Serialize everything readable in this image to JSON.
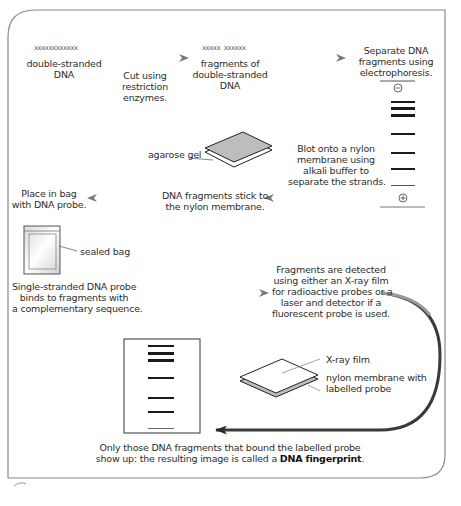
{
  "diagram": {
    "colors": {
      "frame": "#7a7a7a",
      "arrow_grey": "#8a8a8a",
      "arrow_dark": "#2a2a2a",
      "band": "#1a1a1a",
      "gel_fill": "#bdbdbd"
    },
    "row1": {
      "dna_glyph_1": "xxxxxxxxxxxx",
      "label_1_line1": "double-stranded",
      "label_1_line2": "DNA",
      "step_1_line1": "Cut using",
      "step_1_line2": "restriction",
      "step_1_line3": "enzymes.",
      "dna_glyph_2": "xxxxx xxxxxx",
      "label_2_line1": "fragments of",
      "label_2_line2": "double-stranded",
      "label_2_line3": "DNA",
      "step_2_line1": "Separate DNA",
      "step_2_line2": "fragments using",
      "step_2_line3": "electrophoresis."
    },
    "gel": {
      "negative_symbol": "⊖",
      "positive_symbol": "⊕"
    },
    "row2": {
      "agarose_label": "agarose gel",
      "blot_line1": "Blot onto a nylon",
      "blot_line2": "membrane using",
      "blot_line3": "alkali buffer to",
      "blot_line4": "separate the strands.",
      "stick_line1": "DNA fragments stick to",
      "stick_line2": "the nylon membrane.",
      "bag_line1": "Place in bag",
      "bag_line2": "with DNA probe."
    },
    "row3": {
      "sealed_bag_label": "sealed bag",
      "probe_line1": "Single-stranded DNA probe",
      "probe_line2": "binds to fragments with",
      "probe_line3": "a complementary sequence.",
      "detect_line1": "Fragments are detected",
      "detect_line2": "using either an X-ray film",
      "detect_line3": "for radioactive probes or a",
      "detect_line4": "laser and detector if a",
      "detect_line5": "fluorescent probe is used.",
      "xray_label": "X-ray film",
      "membrane_line1": "nylon membrane with",
      "membrane_line2": "labelled probe"
    },
    "caption": {
      "line1": "Only those DNA fragments that bound the labelled probe",
      "line2_prefix": "show up: the resulting image is called a ",
      "line2_bold": "DNA fingerprint",
      "line2_suffix": "."
    }
  }
}
